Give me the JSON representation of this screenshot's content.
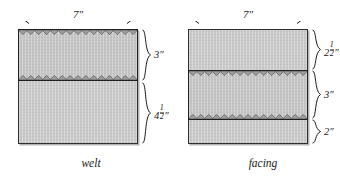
{
  "figure": {
    "unit_symbol": "″",
    "colors": {
      "fabric_fill": "#c9c9c9",
      "strip_fill": "#c4c4c4",
      "outline": "#2e2e2e",
      "strip_outline": "#1f1f1f",
      "shadow": "#8a8a8a",
      "background": "#ffffff",
      "text": "#1a1a1a"
    }
  },
  "diagrams": [
    {
      "id": "welt",
      "caption": "welt",
      "width_dimension": {
        "label": "7″",
        "value": 7,
        "unit": "inch",
        "arrow": "double-headed-horizontal"
      },
      "segments": [
        {
          "id": "welt-strip",
          "kind": "strip",
          "label": "3″",
          "value": 3,
          "unit": "inch",
          "pinked_edges": [
            "top",
            "bottom"
          ]
        },
        {
          "id": "welt-lower",
          "kind": "plain",
          "label_whole": "4",
          "label_numerator": "1",
          "label_denominator": "2",
          "label": "4½″",
          "value": 4.5,
          "unit": "inch",
          "pinked_edges": []
        }
      ]
    },
    {
      "id": "facing",
      "caption": "facing",
      "width_dimension": {
        "label": "7″",
        "value": 7,
        "unit": "inch",
        "arrow": "double-headed-horizontal"
      },
      "segments": [
        {
          "id": "facing-upper",
          "kind": "plain",
          "label_whole": "2",
          "label_numerator": "1",
          "label_denominator": "2",
          "label": "2½″",
          "value": 2.5,
          "unit": "inch",
          "pinked_edges": []
        },
        {
          "id": "facing-strip",
          "kind": "strip",
          "label": "3″",
          "value": 3,
          "unit": "inch",
          "pinked_edges": [
            "top",
            "bottom"
          ]
        },
        {
          "id": "facing-lower",
          "kind": "plain",
          "label": "2″",
          "value": 2,
          "unit": "inch",
          "pinked_edges": []
        }
      ]
    }
  ]
}
